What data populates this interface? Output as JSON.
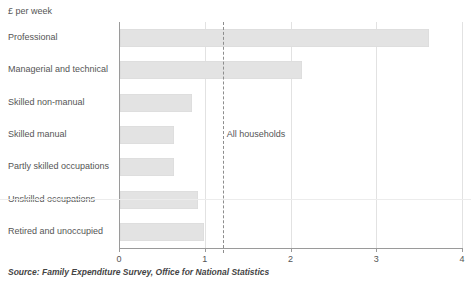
{
  "chart_data": {
    "type": "bar",
    "orientation": "horizontal",
    "title": "",
    "subtitle": "",
    "unit_caption": "£ per week",
    "xlabel": "",
    "ylabel": "",
    "xlim": [
      0,
      4
    ],
    "x_ticks": [
      0,
      1,
      2,
      3,
      4
    ],
    "x_tick_labels": [
      "0",
      "1",
      "2",
      "3",
      "4"
    ],
    "grid": "vertical",
    "legend": "none",
    "categories": [
      "Professional",
      "Managerial and technical",
      "Skilled non-manual",
      "Skilled manual",
      "Partly skilled occupations",
      "Unskilled occupations",
      "Retired and unoccupied"
    ],
    "values": [
      3.6,
      2.12,
      0.84,
      0.63,
      0.63,
      0.91,
      0.98
    ],
    "bar_color": "#e3e3e3",
    "axis_color": "#9a9a9a",
    "gridline_color": "#e2e2e2",
    "annotations": [
      {
        "label": "All households",
        "type": "reference-line",
        "value": 1.21,
        "style": "dashed",
        "color": "#8d8d8d"
      }
    ],
    "source": "Source: Family Expenditure Survey, Office for National Statistics"
  },
  "source_note": "Source: Family Expenditure Survey, Office for National Statistics"
}
